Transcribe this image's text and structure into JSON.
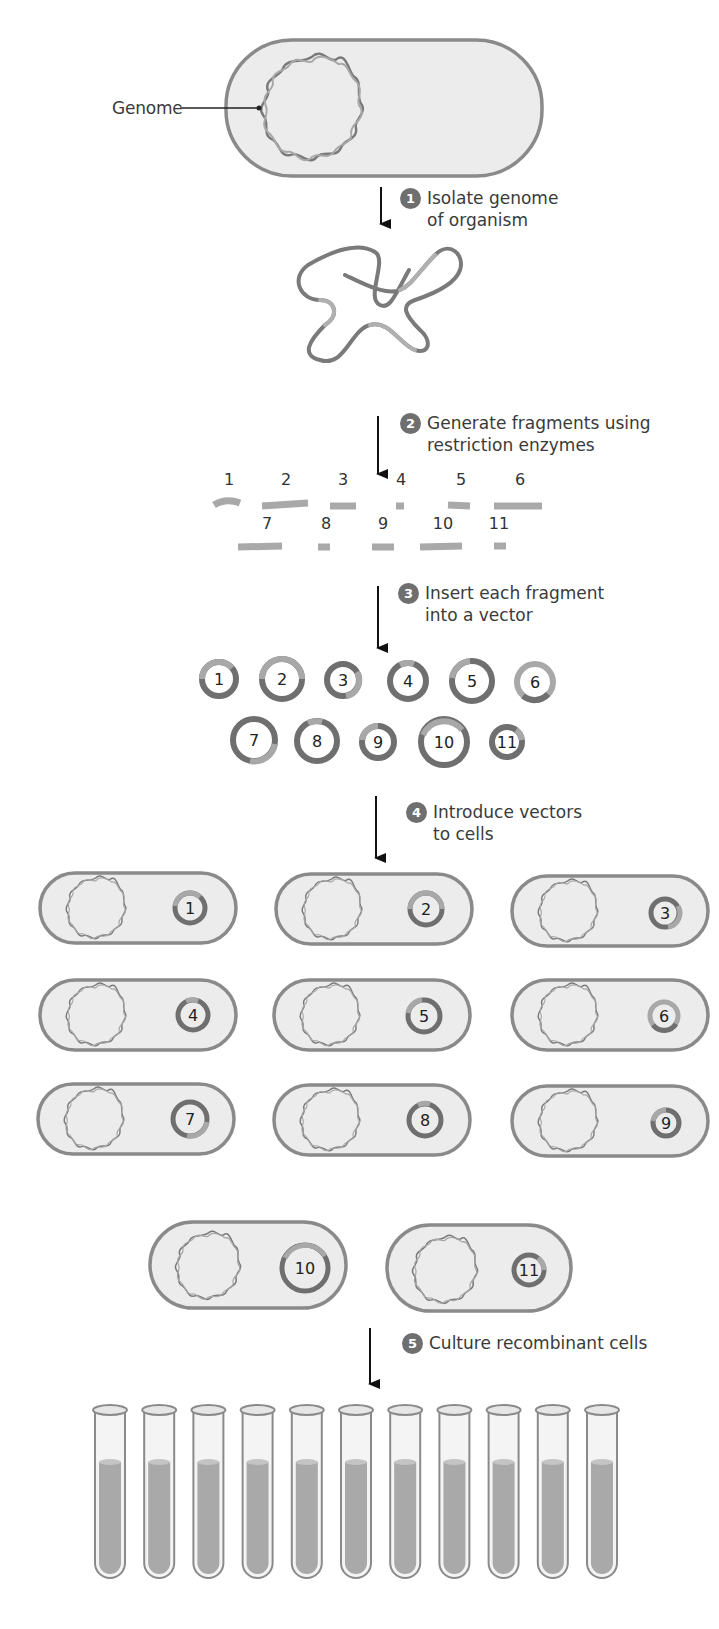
{
  "figure": {
    "genome_label": "Genome",
    "colors": {
      "cell_fill": "#ececec",
      "cell_border": "#8a8a8a",
      "dna_dark": "#7a7a7a",
      "dna_light": "#b8b8b8",
      "badge": "#6f6f6f",
      "arrow": "#111111",
      "tube_liquid": "#a9a9a9"
    }
  },
  "steps": [
    {
      "number": "1",
      "text": "Isolate genome\nof organism"
    },
    {
      "number": "2",
      "text": "Generate fragments using\nrestriction enzymes"
    },
    {
      "number": "3",
      "text": "Insert each fragment\ninto a vector"
    },
    {
      "number": "4",
      "text": "Introduce vectors\nto cells"
    },
    {
      "number": "5",
      "text": "Culture recombinant cells"
    }
  ],
  "fragments": {
    "row1": [
      "1",
      "2",
      "3",
      "4",
      "5",
      "6"
    ],
    "row2": [
      "7",
      "8",
      "9",
      "10",
      "11"
    ]
  },
  "vectors": {
    "row1": [
      "1",
      "2",
      "3",
      "4",
      "5",
      "6"
    ],
    "row2": [
      "7",
      "8",
      "9",
      "10",
      "11"
    ]
  },
  "recombinant_cells": [
    [
      "1",
      "2",
      "3"
    ],
    [
      "4",
      "5",
      "6"
    ],
    [
      "7",
      "8",
      "9"
    ],
    [
      "10",
      "11"
    ]
  ],
  "culture_tubes": {
    "count": 11
  }
}
